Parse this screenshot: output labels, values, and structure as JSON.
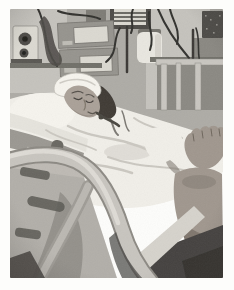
{
  "figure": {
    "kind": "grayscale-photograph"
  },
  "scene": {
    "objects": [
      "equipment-wall",
      "knob-panel",
      "infusion-pump-upper",
      "infusion-pump-lower",
      "patient-monitor",
      "white-canister",
      "mounting-rails",
      "iv-pole",
      "cables",
      "headboard-bars",
      "pillow",
      "head-bandage",
      "patient-face",
      "hair",
      "white-bedding",
      "blanket-folds",
      "bare-feet",
      "bed-side-rail",
      "rail-slots",
      "under-bed-shadow",
      "sheet-fold"
    ]
  },
  "palette": {
    "paper": "#fdfdfb",
    "photo_base": "#aeaca6",
    "wall_light": "#c5c3bd",
    "device_dark": "#4d4b47",
    "device_mid": "#96948e",
    "device_light": "#dbd9d1",
    "screen_stripe": "#6b6964",
    "cable": "#33322f",
    "canister": "#e9e7e0",
    "linen": "#f1efe9",
    "pillow": "#f6f4ee",
    "linen_shadow": "#cbc8c1",
    "skin": "#aaa198",
    "skin_shadow": "#8a8178",
    "hair": "#3f3b36",
    "rail_panel": "#b2afa9",
    "rail_tube": "#c8c5bf",
    "rail_tube_hi": "#e0ddd7",
    "rail_edge": "#8d8a84",
    "slot": "#5b5954",
    "under_dark": "#454340",
    "deep_dark": "#32302d",
    "foot": "#a0978e",
    "foot_dark": "#6e665d",
    "bedside": "#9b9892",
    "sheet_fold": "#d6d3cc"
  }
}
